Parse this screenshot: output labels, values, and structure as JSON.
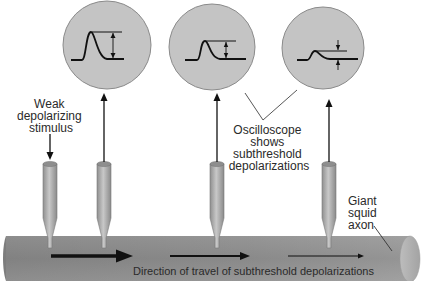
{
  "diagram": {
    "labels": {
      "stimulus": [
        "Weak",
        "depolarizing",
        "stimulus"
      ],
      "oscilloscope": [
        "Oscilloscope",
        "shows",
        "subthreshold",
        "depolarizations"
      ],
      "axon": [
        "Giant",
        "squid",
        "axon"
      ],
      "direction": "Direction of travel of subthreshold depolarizations"
    },
    "oscilloscopes": [
      {
        "id": "scope-1",
        "amplitude": "large"
      },
      {
        "id": "scope-2",
        "amplitude": "medium"
      },
      {
        "id": "scope-3",
        "amplitude": "small"
      }
    ],
    "electrodes": [
      {
        "id": "stimulating-electrode",
        "role": "stimulus"
      },
      {
        "id": "recording-electrode-1",
        "role": "recording"
      },
      {
        "id": "recording-electrode-2",
        "role": "recording"
      },
      {
        "id": "recording-electrode-3",
        "role": "recording"
      }
    ],
    "colors": {
      "scope_fill": "#c4c4c4",
      "axon_fill": "#8e8e8e",
      "electrode_fill": "#a9a9a9",
      "ink": "#111111"
    }
  }
}
